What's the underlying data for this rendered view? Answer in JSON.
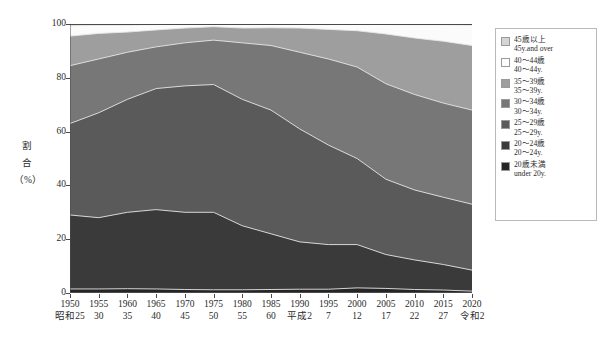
{
  "chart_data": {
    "type": "area",
    "stacked": true,
    "stack_mode": "percent",
    "title": "",
    "xlabel": "",
    "ylabel": "割合 (%)",
    "ylabel_lines": [
      "割",
      "合",
      "（%）"
    ],
    "ylim": [
      0,
      100
    ],
    "yticks": [
      0,
      20,
      40,
      60,
      80,
      100
    ],
    "grid": false,
    "legend_position": "right",
    "categories": [
      1950,
      1955,
      1960,
      1965,
      1970,
      1975,
      1980,
      1985,
      1990,
      1995,
      2000,
      2005,
      2010,
      2015,
      2020
    ],
    "x_labels": [
      {
        "year": "1950",
        "era": "昭和25"
      },
      {
        "year": "1955",
        "era": "30"
      },
      {
        "year": "1960",
        "era": "35"
      },
      {
        "year": "1965",
        "era": "40"
      },
      {
        "year": "1970",
        "era": "45"
      },
      {
        "year": "1975",
        "era": "50"
      },
      {
        "year": "1980",
        "era": "55"
      },
      {
        "year": "1985",
        "era": "60"
      },
      {
        "year": "1990",
        "era": "平成2"
      },
      {
        "year": "1995",
        "era": "7"
      },
      {
        "year": "2000",
        "era": "12"
      },
      {
        "year": "2005",
        "era": "17"
      },
      {
        "year": "2010",
        "era": "22"
      },
      {
        "year": "2015",
        "era": "27"
      },
      {
        "year": "2020",
        "era": "令和2"
      }
    ],
    "series": [
      {
        "name": "20歳未満",
        "name_en": "under 20y.",
        "color": "#252525",
        "values": [
          1.5,
          1.5,
          1.6,
          1.5,
          1.3,
          1.2,
          1.2,
          1.3,
          1.4,
          1.4,
          1.9,
          1.7,
          1.3,
          1.1,
          0.7
        ]
      },
      {
        "name": "20～24歳",
        "name_en": "20～24y.",
        "color": "#3a3a3a",
        "values": [
          27.5,
          26.5,
          28.4,
          29.5,
          28.7,
          28.8,
          23.8,
          20.7,
          17.6,
          16.6,
          16.1,
          12.6,
          11.0,
          9.5,
          7.8
        ]
      },
      {
        "name": "25～29歳",
        "name_en": "25～29y.",
        "color": "#5a5a5a",
        "values": [
          34.0,
          39.0,
          42.0,
          45.0,
          47.0,
          47.5,
          47.0,
          46.0,
          42.0,
          37.0,
          32.0,
          28.0,
          26.0,
          25.0,
          24.5
        ]
      },
      {
        "name": "30～34歳",
        "name_en": "30～34y.",
        "color": "#777777",
        "values": [
          21.5,
          20.0,
          17.5,
          15.5,
          16.0,
          16.5,
          21.0,
          24.0,
          28.5,
          32.0,
          34.0,
          35.5,
          35.5,
          35.0,
          35.0
        ]
      },
      {
        "name": "35～39歳",
        "name_en": "35～39y.",
        "color": "#9e9e9e",
        "values": [
          11.0,
          9.5,
          7.5,
          6.3,
          5.5,
          5.0,
          5.5,
          6.6,
          9.0,
          11.0,
          13.5,
          18.5,
          21.0,
          23.0,
          24.0
        ]
      },
      {
        "name": "40～44歳",
        "name_en": "40～44y.",
        "color": "#fbfbfb",
        "values": [
          3.8,
          3.0,
          2.5,
          2.0,
          1.3,
          0.9,
          1.3,
          1.3,
          1.4,
          1.8,
          2.4,
          3.5,
          4.9,
          6.1,
          7.5
        ]
      },
      {
        "name": "45歳以上",
        "name_en": "45y.and over",
        "color": "#d4d4d4",
        "values": [
          0.7,
          0.5,
          0.5,
          0.2,
          0.2,
          0.1,
          0.2,
          0.1,
          0.1,
          0.2,
          0.1,
          0.2,
          0.3,
          0.3,
          0.5
        ]
      }
    ]
  },
  "legend": {
    "items": [
      {
        "ja": "45歳以上",
        "en": "45y.and over",
        "color": "#d4d4d4"
      },
      {
        "ja": "40～44歳",
        "en": "40～44y.",
        "color": "#fdfdfd"
      },
      {
        "ja": "35～39歳",
        "en": "35～39y.",
        "color": "#9e9e9e"
      },
      {
        "ja": "30～34歳",
        "en": "30～34y.",
        "color": "#777777"
      },
      {
        "ja": "25～29歳",
        "en": "25～29y.",
        "color": "#5a5a5a"
      },
      {
        "ja": "20～24歳",
        "en": "20～24y.",
        "color": "#3a3a3a"
      },
      {
        "ja": "20歳未満",
        "en": "under 20y.",
        "color": "#252525"
      }
    ]
  }
}
